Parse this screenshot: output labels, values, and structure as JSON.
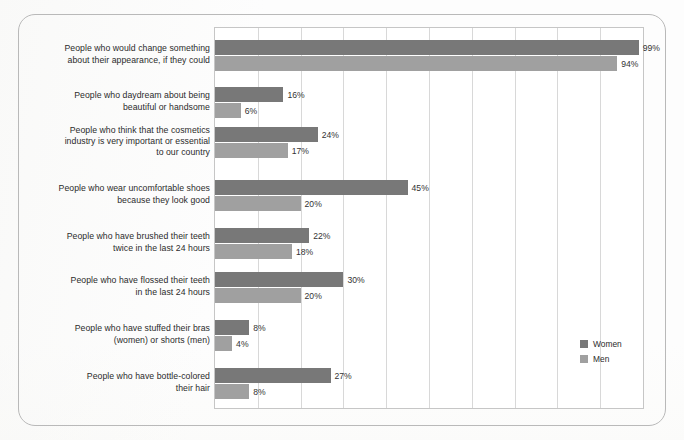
{
  "figure": {
    "frame_style": "rounded-rectangle-border",
    "border_color": "#b9b9b9",
    "background_color": "#fdfdfd"
  },
  "legend": {
    "position": "inside-bottom-right",
    "items": [
      {
        "label": "Women",
        "color": "#787878",
        "icon": "square-swatch-icon"
      },
      {
        "label": "Men",
        "color": "#a0a0a0",
        "icon": "square-swatch-icon"
      }
    ]
  },
  "chart_data": {
    "type": "bar",
    "orientation": "horizontal",
    "title": "",
    "subtitle": "",
    "xlabel": "",
    "ylabel": "",
    "xlim": [
      0,
      100
    ],
    "grid": true,
    "grid_interval": 10,
    "tick_labels_visible": false,
    "value_label_suffix": "%",
    "legend_position": "inside-bottom-right",
    "categories": [
      "People who would change something about their appearance, if they could",
      "People who daydream about being beautiful or handsome",
      "People who think that the cosmetics industry is very important or essential to our country",
      "People who wear uncomfortable shoes because they look good",
      "People who have brushed their teeth twice in the last 24 hours",
      "People who have flossed their teeth in the last 24 hours",
      "People who have stuffed their bras (women) or shorts (men)",
      "People who have bottle-colored their hair"
    ],
    "category_lines": [
      [
        "People who would change something",
        "about their appearance, if they could"
      ],
      [
        "People who daydream about being",
        "beautiful or handsome"
      ],
      [
        "People who think that the cosmetics",
        "industry is very important or essential",
        "to our country"
      ],
      [
        "People who wear uncomfortable shoes",
        "because they look good"
      ],
      [
        "People who have brushed their teeth",
        "twice in the last 24 hours"
      ],
      [
        "People who have flossed their teeth",
        "in the last 24 hours"
      ],
      [
        "People who have stuffed their bras",
        "(women) or shorts (men)"
      ],
      [
        "People who have bottle-colored",
        "their hair"
      ]
    ],
    "series": [
      {
        "name": "Women",
        "color": "#787878",
        "values": [
          99,
          16,
          24,
          45,
          22,
          30,
          8,
          27
        ],
        "labels": [
          "99%",
          "16%",
          "24%",
          "45%",
          "22%",
          "30%",
          "8%",
          "27%"
        ]
      },
      {
        "name": "Men",
        "color": "#a0a0a0",
        "values": [
          94,
          6,
          17,
          20,
          18,
          20,
          4,
          8
        ],
        "labels": [
          "94%",
          "6%",
          "17%",
          "20%",
          "18%",
          "20%",
          "4%",
          "8%"
        ]
      }
    ]
  }
}
